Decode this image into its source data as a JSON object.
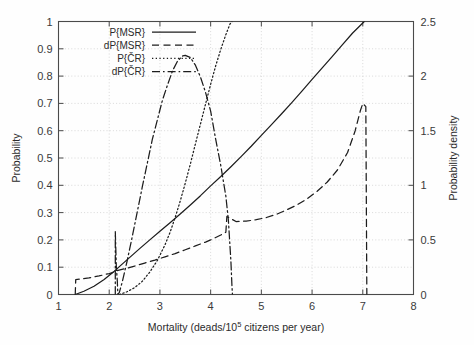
{
  "chart_data": {
    "type": "line",
    "title": "",
    "xlabel": "Mortality (deads/10^5 citizens per year)",
    "xlabel_prefix": "Mortality (deads/10",
    "xlabel_exponent": "5",
    "xlabel_suffix": " citizens per year)",
    "ylabel_left": "Probability",
    "ylabel_right": "Probability density",
    "xlim": [
      1,
      8
    ],
    "ylim_left": [
      0,
      1
    ],
    "ylim_right": [
      0,
      2.5
    ],
    "xticks": [
      "1",
      "2",
      "3",
      "4",
      "5",
      "6",
      "7",
      "8"
    ],
    "xtick_values": [
      1,
      2,
      3,
      4,
      5,
      6,
      7,
      8
    ],
    "yticks_left": [
      "0",
      "0.1",
      "0.2",
      "0.3",
      "0.4",
      "0.5",
      "0.6",
      "0.7",
      "0.8",
      "0.9",
      "1"
    ],
    "ytick_left_values": [
      0,
      0.1,
      0.2,
      0.3,
      0.4,
      0.5,
      0.6,
      0.7,
      0.8,
      0.9,
      1
    ],
    "yticks_right": [
      "0",
      "0.5",
      "1",
      "1.5",
      "2",
      "2.5"
    ],
    "ytick_right_values": [
      0,
      0.5,
      1,
      1.5,
      2,
      2.5
    ],
    "grid": true,
    "grid_style": "dotted",
    "legend_position": "top-left",
    "legend": [
      {
        "label": "P{MSR}",
        "dash": "solid",
        "axis": "left"
      },
      {
        "label": "dP{MSR}",
        "dash": "dashed",
        "axis": "right"
      },
      {
        "label": "P{ČR}",
        "dash": "dotted",
        "axis": "left"
      },
      {
        "label": "dP{ČR}",
        "dash": "dashdot",
        "axis": "right"
      }
    ],
    "series": [
      {
        "name": "P{MSR}",
        "dash": "solid",
        "axis": "left",
        "points": [
          [
            1.33,
            0.0
          ],
          [
            1.5,
            0.012
          ],
          [
            1.7,
            0.03
          ],
          [
            1.9,
            0.055
          ],
          [
            2.1,
            0.085
          ],
          [
            2.2,
            0.102
          ],
          [
            2.4,
            0.135
          ],
          [
            2.6,
            0.168
          ],
          [
            2.8,
            0.2
          ],
          [
            3.0,
            0.232
          ],
          [
            3.2,
            0.263
          ],
          [
            3.4,
            0.295
          ],
          [
            3.6,
            0.328
          ],
          [
            3.8,
            0.362
          ],
          [
            4.0,
            0.398
          ],
          [
            4.2,
            0.432
          ],
          [
            4.4,
            0.468
          ],
          [
            4.6,
            0.505
          ],
          [
            4.8,
            0.543
          ],
          [
            5.0,
            0.583
          ],
          [
            5.2,
            0.622
          ],
          [
            5.4,
            0.662
          ],
          [
            5.6,
            0.703
          ],
          [
            5.8,
            0.745
          ],
          [
            6.0,
            0.788
          ],
          [
            6.2,
            0.83
          ],
          [
            6.4,
            0.872
          ],
          [
            6.6,
            0.915
          ],
          [
            6.8,
            0.958
          ],
          [
            7.03,
            1.0
          ]
        ]
      },
      {
        "name": "dP{MSR}",
        "dash": "dashed",
        "axis": "right",
        "points": [
          [
            1.33,
            0.0
          ],
          [
            1.34,
            0.137
          ],
          [
            1.6,
            0.152
          ],
          [
            1.8,
            0.17
          ],
          [
            2.0,
            0.192
          ],
          [
            2.1,
            0.205
          ],
          [
            2.15,
            0.218
          ],
          [
            2.3,
            0.235
          ],
          [
            2.5,
            0.26
          ],
          [
            2.7,
            0.288
          ],
          [
            2.9,
            0.315
          ],
          [
            3.1,
            0.345
          ],
          [
            3.3,
            0.375
          ],
          [
            3.5,
            0.41
          ],
          [
            3.7,
            0.445
          ],
          [
            3.9,
            0.48
          ],
          [
            4.0,
            0.5
          ],
          [
            4.1,
            0.522
          ],
          [
            4.2,
            0.545
          ],
          [
            4.3,
            0.57
          ],
          [
            4.32,
            0.715
          ],
          [
            4.5,
            0.668
          ],
          [
            4.7,
            0.672
          ],
          [
            4.9,
            0.685
          ],
          [
            5.1,
            0.705
          ],
          [
            5.3,
            0.735
          ],
          [
            5.5,
            0.775
          ],
          [
            5.7,
            0.82
          ],
          [
            5.9,
            0.875
          ],
          [
            6.1,
            0.945
          ],
          [
            6.3,
            1.03
          ],
          [
            6.5,
            1.14
          ],
          [
            6.7,
            1.3
          ],
          [
            6.85,
            1.5
          ],
          [
            6.95,
            1.68
          ],
          [
            7.0,
            1.75
          ],
          [
            7.06,
            1.72
          ],
          [
            7.08,
            0.0
          ]
        ],
        "note": "values on right axis (probability density), peak 1.75 at x=7.0"
      },
      {
        "name": "P{ČR}",
        "dash": "dotted",
        "axis": "left",
        "points": [
          [
            2.2,
            0.0
          ],
          [
            2.35,
            0.01
          ],
          [
            2.5,
            0.025
          ],
          [
            2.65,
            0.048
          ],
          [
            2.8,
            0.082
          ],
          [
            2.95,
            0.125
          ],
          [
            3.1,
            0.182
          ],
          [
            3.2,
            0.228
          ],
          [
            3.3,
            0.282
          ],
          [
            3.4,
            0.342
          ],
          [
            3.5,
            0.408
          ],
          [
            3.6,
            0.478
          ],
          [
            3.7,
            0.552
          ],
          [
            3.8,
            0.625
          ],
          [
            3.9,
            0.698
          ],
          [
            4.0,
            0.77
          ],
          [
            4.1,
            0.838
          ],
          [
            4.2,
            0.898
          ],
          [
            4.3,
            0.952
          ],
          [
            4.38,
            0.99
          ],
          [
            4.42,
            1.0
          ]
        ]
      },
      {
        "name": "dP{ČR}",
        "dash": "dashdot",
        "axis": "right",
        "points": [
          [
            2.12,
            0.0
          ],
          [
            2.12,
            0.575
          ],
          [
            2.14,
            0.26
          ],
          [
            2.16,
            0.12
          ],
          [
            2.17,
            0.0
          ],
          [
            2.2,
            0.02
          ],
          [
            2.26,
            0.12
          ],
          [
            2.35,
            0.3
          ],
          [
            2.45,
            0.52
          ],
          [
            2.55,
            0.75
          ],
          [
            2.65,
            0.98
          ],
          [
            2.75,
            1.2
          ],
          [
            2.85,
            1.42
          ],
          [
            2.95,
            1.6
          ],
          [
            3.05,
            1.78
          ],
          [
            3.15,
            1.92
          ],
          [
            3.25,
            2.05
          ],
          [
            3.35,
            2.14
          ],
          [
            3.45,
            2.185
          ],
          [
            3.5,
            2.19
          ],
          [
            3.6,
            2.17
          ],
          [
            3.7,
            2.1
          ],
          [
            3.8,
            1.99
          ],
          [
            3.9,
            1.85
          ],
          [
            4.0,
            1.68
          ],
          [
            4.1,
            1.42
          ],
          [
            4.2,
            1.18
          ],
          [
            4.3,
            0.9
          ],
          [
            4.35,
            0.68
          ],
          [
            4.4,
            0.3
          ],
          [
            4.42,
            0.08
          ],
          [
            4.43,
            0.0
          ]
        ],
        "note": "values on right axis (probability density), peak ~2.19 at x=3.5"
      }
    ]
  }
}
